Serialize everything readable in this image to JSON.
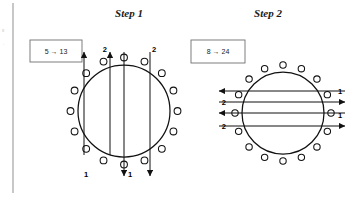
{
  "figure": {
    "background_color": "#ffffff",
    "stroke_color": "#111111",
    "rule_color": "#9a9a9a",
    "margin_marks": [
      "≡",
      "·"
    ],
    "panels": [
      {
        "id": "step-1",
        "title": "Step 1",
        "title_x": 129,
        "title_y": 17,
        "box": {
          "label": "5 → 13",
          "from": "5",
          "to": "13",
          "x": 30,
          "y": 40,
          "width": 52,
          "height": 22
        },
        "circle": {
          "cx": 124,
          "cy": 111,
          "r": 46
        },
        "node_count": 16,
        "node_radius": 3.4,
        "node_offset": 7.5,
        "orientation": "vertical",
        "arrows": [
          {
            "x": 84,
            "y1": 155,
            "y2": 52,
            "dir": "up"
          },
          {
            "x": 110,
            "y1": 155,
            "y2": 52,
            "dir": "up"
          },
          {
            "x": 124,
            "y1": 52,
            "y2": 176,
            "dir": "down"
          },
          {
            "x": 150,
            "y1": 52,
            "y2": 176,
            "dir": "down"
          }
        ],
        "labels": [
          {
            "text": "2",
            "x": 107,
            "y": 52,
            "anchor": "end"
          },
          {
            "text": "2",
            "x": 152,
            "y": 52,
            "anchor": "start"
          },
          {
            "text": "1",
            "x": 86,
            "y": 177,
            "anchor": "middle"
          },
          {
            "text": "1",
            "x": 128,
            "y": 177,
            "anchor": "start"
          }
        ]
      },
      {
        "id": "step-2",
        "title": "Step 2",
        "title_x": 268,
        "title_y": 17,
        "box": {
          "label": "8 → 24",
          "from": "8",
          "to": "24",
          "x": 191,
          "y": 40,
          "width": 54,
          "height": 23
        },
        "circle": {
          "cx": 283,
          "cy": 113,
          "r": 41
        },
        "node_count": 16,
        "node_radius": 3.2,
        "node_offset": 7,
        "orientation": "horizontal",
        "arrows": [
          {
            "y": 91,
            "x1": 345,
            "x2": 219,
            "dir": "left"
          },
          {
            "y": 113,
            "x1": 345,
            "x2": 219,
            "dir": "left"
          },
          {
            "y": 102,
            "x1": 219,
            "x2": 345,
            "dir": "right"
          },
          {
            "y": 126,
            "x1": 219,
            "x2": 345,
            "dir": "right"
          }
        ],
        "labels": [
          {
            "text": "2",
            "x": 226,
            "y": 105,
            "anchor": "end"
          },
          {
            "text": "2",
            "x": 226,
            "y": 129,
            "anchor": "end"
          },
          {
            "text": "1",
            "x": 338,
            "y": 94,
            "anchor": "start"
          },
          {
            "text": "1",
            "x": 338,
            "y": 118,
            "anchor": "start"
          }
        ]
      }
    ],
    "vertical_rule": {
      "x": 13,
      "y1": 3,
      "y2": 193
    }
  }
}
